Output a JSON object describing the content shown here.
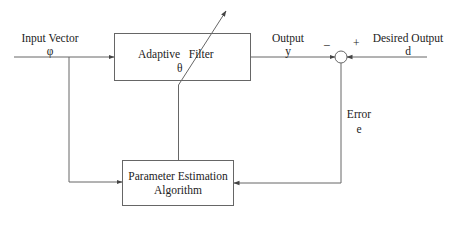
{
  "diagram": {
    "input": {
      "label": "Input Vector",
      "symbol": "φ"
    },
    "adaptive_filter": {
      "label": "Adaptive   Filter",
      "param": "θ"
    },
    "output": {
      "label": "Output",
      "symbol": "y"
    },
    "desired": {
      "label": "Desired Output",
      "symbol": "d"
    },
    "summer": {
      "minus": "–",
      "plus": "+"
    },
    "error": {
      "label": "Error",
      "symbol": "e"
    },
    "estimator": {
      "line1": "Parameter Estimation",
      "line2": "Algorithm"
    },
    "colors": {
      "line": "#555555",
      "text": "#222222",
      "background": "#ffffff"
    }
  }
}
